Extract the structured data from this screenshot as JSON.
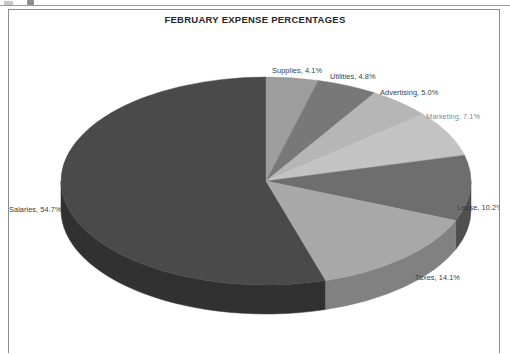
{
  "window": {
    "top_artifact": "cut-off-toolbar-row"
  },
  "chart_frame": {
    "border_color": "#8c8c8c",
    "background": "#ffffff"
  },
  "chart_data": {
    "type": "pie",
    "title": "FEBRUARY EXPENSE PERCENTAGES",
    "subtitle": "",
    "xlabel": "",
    "ylabel": "",
    "legend_position": "none",
    "grid": false,
    "three_d": true,
    "value_unit": "percent",
    "categories": [
      "Salaries",
      "Supplies",
      "Utilities",
      "Advertising",
      "Marketing",
      "Lease",
      "Taxes"
    ],
    "values": [
      54.7,
      4.1,
      4.8,
      5.0,
      7.1,
      10.2,
      14.1
    ],
    "labels": [
      "Salaries, 54.7%",
      "Supplies, 4.1%",
      "Utilities, 4.8%",
      "Advertising, 5.0%",
      "Marketing, 7.1%",
      "Lease, 10.2%",
      "Taxes, 14.1%"
    ],
    "slice_colors": [
      "#4a4a4a",
      "#9d9d9d",
      "#787878",
      "#b6b6b6",
      "#c3c3c3",
      "#6e6e6e",
      "#a8a8a8"
    ],
    "slice_side_colors": [
      "#313131",
      "#767676",
      "#575757",
      "#8e8e8e",
      "#999999",
      "#4f4f4f",
      "#818181"
    ]
  },
  "labels": {
    "salaries": "Salaries, 54.7%",
    "supplies": "Supplies, 4.1%",
    "utilities": "Utilities, 4.8%",
    "advertising": "Advertising, 5.0%",
    "marketing": "Marketing, 7.1%",
    "lease": "Lease, 10.2%",
    "taxes": "Taxes, 14.1%"
  }
}
